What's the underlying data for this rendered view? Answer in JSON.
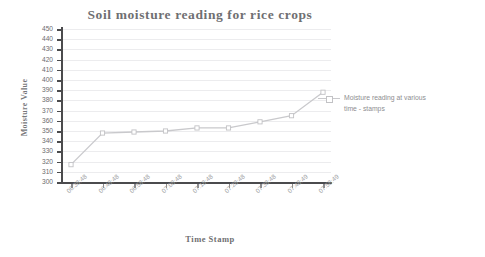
{
  "chart_data": {
    "type": "line",
    "title": "Soil moisture reading for rice crops",
    "xlabel": "Time Stamp",
    "ylabel": "Moisture Value",
    "categories": [
      "06:38:48",
      "06:48:48",
      "06:58:48",
      "07:08:48",
      "07:18:48",
      "07:28:48",
      "07:38:48",
      "07:48:49",
      "07:58:49"
    ],
    "values": [
      317,
      348,
      349,
      350,
      353,
      353,
      359,
      365,
      388
    ],
    "series": [
      {
        "name": "Moisture reading at various time - stamps",
        "values": [
          317,
          348,
          349,
          350,
          353,
          353,
          359,
          365,
          388
        ]
      }
    ],
    "ylim": [
      300,
      450
    ],
    "ytick_step": 10,
    "yticks": [
      300,
      310,
      320,
      330,
      340,
      350,
      360,
      370,
      380,
      390,
      400,
      410,
      420,
      430,
      440,
      450
    ],
    "grid": true,
    "legend_position": "right",
    "colors": {
      "line": "#c9c9cc",
      "marker": "#c2c2c5",
      "axis": "#4b4b4d",
      "grid": "#ececee",
      "title_text": "#6f6f72",
      "tick_text": "#6b6b6e"
    }
  },
  "legend": {
    "entries": [
      {
        "label_line1": "Moisture reading at various",
        "label_line2": "time - stamps"
      }
    ]
  }
}
